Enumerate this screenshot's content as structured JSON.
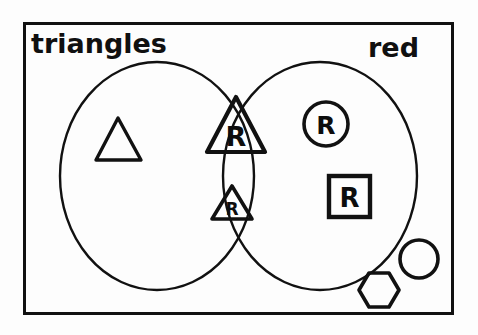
{
  "diagram": {
    "kind": "venn-diagram",
    "title_visible": false,
    "universe_border": {
      "name": "universal-set-rectangle",
      "x": 23,
      "y": 22,
      "width": 430,
      "height": 292,
      "stroke": "#111111",
      "stroke_width": 3
    },
    "sets": [
      {
        "id": "triangles",
        "label": "triangles",
        "label_x": 31,
        "label_y": 52,
        "label_size": 26,
        "circle": {
          "cx": 157,
          "cy": 175,
          "rx": 98,
          "ry": 115
        },
        "stroke": "#111111",
        "stroke_width": 2.4
      },
      {
        "id": "red",
        "label": "red",
        "label_x": 368,
        "label_y": 56,
        "label_size": 26,
        "circle": {
          "cx": 320,
          "cy": 175,
          "rx": 98,
          "ry": 115
        },
        "stroke": "#111111",
        "stroke_width": 2.4
      }
    ],
    "regions": {
      "left_only": "triangles-only",
      "intersection": "triangles-and-red",
      "right_only": "red-only",
      "outside": "neither"
    },
    "elements": [
      {
        "name": "plain-triangle",
        "shape": "triangle",
        "letter": "",
        "region": "triangles-only",
        "cx": 118,
        "cy": 139,
        "size": 42
      },
      {
        "name": "red-triangle-large",
        "shape": "triangle",
        "letter": "R",
        "region": "triangles-and-red",
        "cx": 236,
        "cy": 125,
        "size": 56
      },
      {
        "name": "red-triangle-small",
        "shape": "triangle",
        "letter": "R",
        "region": "triangles-and-red",
        "cx": 232,
        "cy": 205,
        "size": 38
      },
      {
        "name": "red-circle",
        "shape": "circle",
        "letter": "R",
        "region": "red-only",
        "cx": 326,
        "cy": 124,
        "size": 42
      },
      {
        "name": "red-square",
        "shape": "square",
        "letter": "R",
        "region": "red-only",
        "cx": 349,
        "cy": 196,
        "size": 42
      },
      {
        "name": "plain-circle",
        "shape": "circle",
        "letter": "",
        "region": "neither",
        "cx": 419,
        "cy": 259,
        "size": 40
      },
      {
        "name": "plain-hexagon",
        "shape": "hexagon",
        "letter": "",
        "region": "neither",
        "cx": 379,
        "cy": 290,
        "size": 38
      }
    ],
    "counts": {
      "triangles_only": 1,
      "intersection": 2,
      "red_only": 2,
      "neither": 2
    },
    "colors": {
      "ink": "#111111",
      "paper": "#fdfdfd"
    }
  }
}
